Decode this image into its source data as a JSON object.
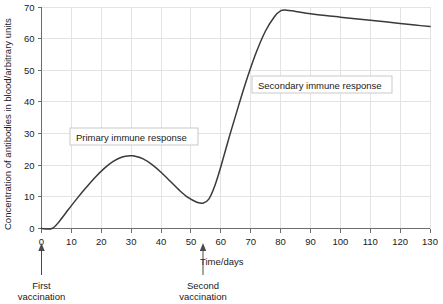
{
  "chart_data": {
    "type": "line",
    "title": "",
    "xlabel": "Time/days",
    "ylabel": "Concentration of antibodies in blood/arbitrary units",
    "xlim": [
      0,
      130
    ],
    "ylim": [
      0,
      70
    ],
    "grid": true,
    "legend_position": "none",
    "x_ticks": [
      0,
      10,
      20,
      30,
      40,
      50,
      60,
      70,
      80,
      90,
      100,
      110,
      120,
      130
    ],
    "y_ticks": [
      0,
      10,
      20,
      30,
      40,
      50,
      60,
      70
    ],
    "series": [
      {
        "name": "Antibody concentration",
        "color": "#3a3a3a",
        "x": [
          0,
          3.5,
          6,
          9,
          12,
          15,
          18,
          21,
          24,
          27,
          30,
          31,
          34,
          37,
          40,
          43,
          46,
          49,
          52,
          54,
          56,
          58,
          60,
          63,
          66,
          69,
          72,
          75,
          78,
          80,
          82,
          85,
          90,
          95,
          100,
          105,
          110,
          115,
          120,
          125,
          130
        ],
        "y": [
          0,
          0,
          2.3,
          6.0,
          9.6,
          13.0,
          16.2,
          19.0,
          21.2,
          22.6,
          23.0,
          22.9,
          22.0,
          20.2,
          17.8,
          15.0,
          12.2,
          9.8,
          8.3,
          8.0,
          9.3,
          13.5,
          19.5,
          29.5,
          39.0,
          48.0,
          56.0,
          62.5,
          67.0,
          68.8,
          69.0,
          68.6,
          67.9,
          67.3,
          66.8,
          66.3,
          65.8,
          65.3,
          64.8,
          64.3,
          63.8
        ]
      }
    ],
    "annotations": [
      {
        "id": "primary-callout",
        "text": "Primary immune response",
        "type": "box-label",
        "x": 12,
        "y": 27.5
      },
      {
        "id": "secondary-callout",
        "text": "Secondary immune response",
        "type": "box-label",
        "x": 70,
        "y": 46
      },
      {
        "id": "first-vaccination",
        "text_line1": "First",
        "text_line2": "vaccination",
        "type": "axis-arrow",
        "x": 0
      },
      {
        "id": "second-vaccination",
        "text_line1": "Second",
        "text_line2": "vaccination",
        "type": "axis-arrow",
        "x": 54
      }
    ]
  },
  "axis": {
    "y_label": "Concentration of antibodies in blood/arbitrary units",
    "x_label": "Time/days",
    "y_ticks": [
      "0",
      "10",
      "20",
      "30",
      "40",
      "50",
      "60",
      "70"
    ],
    "x_ticks": [
      "0",
      "10",
      "20",
      "30",
      "40",
      "50",
      "60",
      "70",
      "80",
      "90",
      "100",
      "110",
      "120",
      "130"
    ]
  },
  "callouts": {
    "primary": "Primary immune response",
    "secondary": "Secondary immune response"
  },
  "vaccination_markers": {
    "first_line1": "First",
    "first_line2": "vaccination",
    "second_line1": "Second",
    "second_line2": "vaccination"
  },
  "colors": {
    "curve": "#3a3a3a",
    "grid": "#e3e3e3",
    "axis": "#6e6e6e",
    "text": "#1a1a1a",
    "callout_border": "#c9c9c9",
    "background": "#ffffff"
  }
}
